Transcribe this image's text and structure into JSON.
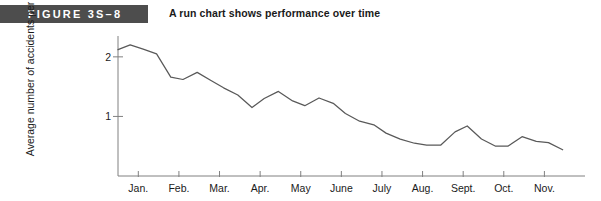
{
  "figure": {
    "banner_label": "FIGURE 3S–8",
    "caption": "A run chart shows performance over time"
  },
  "chart_data": {
    "type": "line",
    "title": "A run chart shows performance over time",
    "xlabel": "",
    "ylabel": "Average number of accidents per day",
    "grid": false,
    "legend": null,
    "xlim": [
      0,
      11.5
    ],
    "ylim": [
      0,
      2.35
    ],
    "y_ticks": [
      1,
      2
    ],
    "y_tick_labels": [
      "1",
      "2"
    ],
    "x_ticks": [
      0.5,
      1.5,
      2.5,
      3.5,
      4.5,
      5.5,
      6.5,
      7.5,
      8.5,
      9.5,
      10.5
    ],
    "categories": [
      "Jan.",
      "Feb.",
      "Mar.",
      "Apr.",
      "May",
      "June",
      "July",
      "Aug.",
      "Sept.",
      "Oct.",
      "Nov."
    ],
    "series": [
      {
        "name": "Average number of accidents per day",
        "x": [
          0.0,
          0.3,
          0.62,
          0.95,
          1.3,
          1.6,
          1.95,
          2.3,
          2.6,
          2.95,
          3.3,
          3.6,
          3.95,
          4.3,
          4.6,
          4.95,
          5.3,
          5.6,
          5.95,
          6.3,
          6.6,
          6.95,
          7.3,
          7.6,
          7.95,
          8.3,
          8.6,
          8.95,
          9.3,
          9.6,
          9.95,
          10.3,
          10.6,
          10.95
        ],
        "values": [
          2.12,
          2.2,
          2.13,
          2.05,
          1.66,
          1.62,
          1.74,
          1.6,
          1.48,
          1.36,
          1.15,
          1.3,
          1.42,
          1.26,
          1.18,
          1.31,
          1.22,
          1.05,
          0.92,
          0.86,
          0.72,
          0.62,
          0.55,
          0.52,
          0.52,
          0.74,
          0.84,
          0.62,
          0.5,
          0.5,
          0.66,
          0.58,
          0.56,
          0.44
        ]
      }
    ]
  },
  "colors": {
    "banner_background": "#4d4d4d",
    "banner_text": "#ffffff",
    "axis": "#808080",
    "line": "#595959",
    "text": "#1a1a1a"
  }
}
